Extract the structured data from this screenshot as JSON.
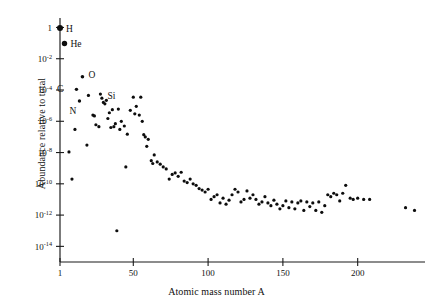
{
  "chart_data": {
    "type": "scatter",
    "title": "",
    "xlabel": "Atomic mass number A",
    "ylabel": "Abundance relative to total",
    "xlim": [
      1,
      245
    ],
    "ylim": [
      1e-15,
      3
    ],
    "yscale": "log",
    "xscale": "linear",
    "grid": false,
    "legend": null,
    "xticks": [
      1,
      50,
      100,
      150,
      200
    ],
    "xticklabels": [
      "1",
      "50",
      "100",
      "150",
      "200"
    ],
    "yticks": [
      1,
      0.01,
      0.0001,
      1e-06,
      1e-08,
      1e-10,
      1e-12,
      1e-14
    ],
    "yticklabels": [
      "1",
      "10-2",
      "10-4",
      "10-6",
      "10-8",
      "10-10",
      "10-12",
      "10-14"
    ],
    "yticklabels_display": [
      {
        "base": "1",
        "exp": ""
      },
      {
        "base": "10",
        "exp": "-2"
      },
      {
        "base": "10",
        "exp": "-4"
      },
      {
        "base": "10",
        "exp": "-6"
      },
      {
        "base": "10",
        "exp": "-8"
      },
      {
        "base": "10",
        "exp": "-10"
      },
      {
        "base": "10",
        "exp": "-12"
      },
      {
        "base": "10",
        "exp": "-14"
      }
    ],
    "annotations": [
      {
        "text": "H",
        "x": 1,
        "y": 0.92,
        "dx": 6,
        "dy": 3.5
      },
      {
        "text": "He",
        "x": 4,
        "y": 0.095,
        "dx": 6,
        "dy": 3.5
      },
      {
        "text": "C",
        "x": 12,
        "y": 0.00011,
        "dx": -13,
        "dy": 3.0
      },
      {
        "text": "N",
        "x": 14,
        "y": 1.9e-05,
        "dx": -3,
        "dy": 13
      },
      {
        "text": "O",
        "x": 16,
        "y": 0.0007,
        "dx": 6,
        "dy": 1.0
      },
      {
        "text": "Si",
        "x": 28,
        "y": 5.5e-05,
        "dx": 7,
        "dy": 5.0
      }
    ],
    "points": [
      {
        "x": 1,
        "y": 0.92,
        "r": 3.0
      },
      {
        "x": 4,
        "y": 0.095,
        "r": 2.7
      },
      {
        "x": 7,
        "y": 1.1e-08,
        "r": 1.6
      },
      {
        "x": 9,
        "y": 2e-10,
        "r": 1.6
      },
      {
        "x": 11,
        "y": 3e-07,
        "r": 1.6
      },
      {
        "x": 12,
        "y": 0.00011,
        "r": 1.7
      },
      {
        "x": 14,
        "y": 2e-05,
        "r": 1.7
      },
      {
        "x": 16,
        "y": 0.0007,
        "r": 1.8
      },
      {
        "x": 19,
        "y": 3e-08,
        "r": 1.6
      },
      {
        "x": 20,
        "y": 4.5e-05,
        "r": 1.6
      },
      {
        "x": 23,
        "y": 2.5e-06,
        "r": 1.6
      },
      {
        "x": 24,
        "y": 2.2e-06,
        "r": 1.6
      },
      {
        "x": 25,
        "y": 6e-07,
        "r": 1.6
      },
      {
        "x": 27,
        "y": 4.5e-07,
        "r": 1.6
      },
      {
        "x": 28,
        "y": 5.5e-05,
        "r": 1.6
      },
      {
        "x": 29,
        "y": 3e-05,
        "r": 1.6
      },
      {
        "x": 30,
        "y": 1.6e-05,
        "r": 1.6
      },
      {
        "x": 31,
        "y": 1.3e-05,
        "r": 1.6
      },
      {
        "x": 32,
        "y": 2.2e-05,
        "r": 1.6
      },
      {
        "x": 33,
        "y": 1.5e-06,
        "r": 1.6
      },
      {
        "x": 34,
        "y": 3.5e-06,
        "r": 1.6
      },
      {
        "x": 35,
        "y": 4e-07,
        "r": 1.6
      },
      {
        "x": 36,
        "y": 5.5e-06,
        "r": 1.6
      },
      {
        "x": 37,
        "y": 4.5e-07,
        "r": 1.6
      },
      {
        "x": 38,
        "y": 7e-07,
        "r": 1.6
      },
      {
        "x": 39,
        "y": 1e-13,
        "r": 1.6
      },
      {
        "x": 40,
        "y": 6e-06,
        "r": 1.6
      },
      {
        "x": 41,
        "y": 3e-07,
        "r": 1.6
      },
      {
        "x": 42,
        "y": 1e-06,
        "r": 1.6
      },
      {
        "x": 44,
        "y": 5e-07,
        "r": 1.6
      },
      {
        "x": 45,
        "y": 1.2e-09,
        "r": 1.6
      },
      {
        "x": 46,
        "y": 1.5e-07,
        "r": 1.6
      },
      {
        "x": 48,
        "y": 5e-06,
        "r": 1.6
      },
      {
        "x": 50,
        "y": 3.5e-05,
        "r": 1.6
      },
      {
        "x": 51,
        "y": 3e-06,
        "r": 1.6
      },
      {
        "x": 52,
        "y": 9e-06,
        "r": 1.6
      },
      {
        "x": 54,
        "y": 2.5e-06,
        "r": 1.6
      },
      {
        "x": 55,
        "y": 3.5e-05,
        "r": 1.6
      },
      {
        "x": 56,
        "y": 1e-06,
        "r": 1.6
      },
      {
        "x": 57,
        "y": 1.4e-07,
        "r": 1.6
      },
      {
        "x": 58,
        "y": 1e-07,
        "r": 1.6
      },
      {
        "x": 59,
        "y": 2.5e-08,
        "r": 1.6
      },
      {
        "x": 60,
        "y": 7e-08,
        "r": 1.6
      },
      {
        "x": 62,
        "y": 3e-09,
        "r": 1.6
      },
      {
        "x": 63,
        "y": 2e-09,
        "r": 1.6
      },
      {
        "x": 64,
        "y": 7e-09,
        "r": 1.6
      },
      {
        "x": 66,
        "y": 2.5e-09,
        "r": 1.6
      },
      {
        "x": 68,
        "y": 1.8e-09,
        "r": 1.6
      },
      {
        "x": 70,
        "y": 1.2e-09,
        "r": 1.6
      },
      {
        "x": 72,
        "y": 9e-10,
        "r": 1.6
      },
      {
        "x": 74,
        "y": 2e-10,
        "r": 1.6
      },
      {
        "x": 76,
        "y": 4e-10,
        "r": 1.6
      },
      {
        "x": 78,
        "y": 5e-10,
        "r": 1.6
      },
      {
        "x": 80,
        "y": 3e-10,
        "r": 1.6
      },
      {
        "x": 82,
        "y": 5.5e-10,
        "r": 1.6
      },
      {
        "x": 84,
        "y": 1.5e-10,
        "r": 1.6
      },
      {
        "x": 86,
        "y": 1.2e-10,
        "r": 1.6
      },
      {
        "x": 88,
        "y": 2e-10,
        "r": 1.6
      },
      {
        "x": 90,
        "y": 1e-10,
        "r": 1.6
      },
      {
        "x": 92,
        "y": 8e-11,
        "r": 1.6
      },
      {
        "x": 94,
        "y": 5e-11,
        "r": 1.6
      },
      {
        "x": 96,
        "y": 4e-11,
        "r": 1.6
      },
      {
        "x": 98,
        "y": 3e-11,
        "r": 1.6
      },
      {
        "x": 100,
        "y": 4.5e-11,
        "r": 1.6
      },
      {
        "x": 102,
        "y": 1e-11,
        "r": 1.6
      },
      {
        "x": 104,
        "y": 1.5e-11,
        "r": 1.6
      },
      {
        "x": 106,
        "y": 2e-11,
        "r": 1.6
      },
      {
        "x": 108,
        "y": 6e-12,
        "r": 1.6
      },
      {
        "x": 110,
        "y": 1.2e-11,
        "r": 1.6
      },
      {
        "x": 112,
        "y": 5e-12,
        "r": 1.6
      },
      {
        "x": 114,
        "y": 9e-12,
        "r": 1.6
      },
      {
        "x": 116,
        "y": 2e-11,
        "r": 1.6
      },
      {
        "x": 118,
        "y": 4.5e-11,
        "r": 1.6
      },
      {
        "x": 120,
        "y": 3e-11,
        "r": 1.6
      },
      {
        "x": 122,
        "y": 7e-12,
        "r": 1.6
      },
      {
        "x": 124,
        "y": 1e-11,
        "r": 1.6
      },
      {
        "x": 126,
        "y": 3.5e-11,
        "r": 1.6
      },
      {
        "x": 128,
        "y": 1.2e-11,
        "r": 1.6
      },
      {
        "x": 130,
        "y": 2e-11,
        "r": 1.6
      },
      {
        "x": 132,
        "y": 1e-11,
        "r": 1.6
      },
      {
        "x": 134,
        "y": 5e-12,
        "r": 1.6
      },
      {
        "x": 136,
        "y": 7e-12,
        "r": 1.6
      },
      {
        "x": 138,
        "y": 1.5e-11,
        "r": 1.6
      },
      {
        "x": 140,
        "y": 6e-12,
        "r": 1.6
      },
      {
        "x": 142,
        "y": 4e-12,
        "r": 1.6
      },
      {
        "x": 144,
        "y": 9e-12,
        "r": 1.6
      },
      {
        "x": 146,
        "y": 5e-12,
        "r": 1.6
      },
      {
        "x": 148,
        "y": 2.5e-12,
        "r": 1.6
      },
      {
        "x": 150,
        "y": 4e-12,
        "r": 1.6
      },
      {
        "x": 152,
        "y": 8e-12,
        "r": 1.6
      },
      {
        "x": 154,
        "y": 3e-12,
        "r": 1.6
      },
      {
        "x": 156,
        "y": 7e-12,
        "r": 1.6
      },
      {
        "x": 158,
        "y": 2.5e-12,
        "r": 1.6
      },
      {
        "x": 160,
        "y": 6e-12,
        "r": 1.6
      },
      {
        "x": 162,
        "y": 8e-12,
        "r": 1.6
      },
      {
        "x": 164,
        "y": 2e-12,
        "r": 1.6
      },
      {
        "x": 166,
        "y": 7e-12,
        "r": 1.6
      },
      {
        "x": 168,
        "y": 3.5e-12,
        "r": 1.6
      },
      {
        "x": 170,
        "y": 6e-12,
        "r": 1.6
      },
      {
        "x": 172,
        "y": 2e-12,
        "r": 1.6
      },
      {
        "x": 174,
        "y": 7e-12,
        "r": 1.6
      },
      {
        "x": 176,
        "y": 1.5e-12,
        "r": 1.6
      },
      {
        "x": 178,
        "y": 4e-12,
        "r": 1.6
      },
      {
        "x": 180,
        "y": 2e-11,
        "r": 1.6
      },
      {
        "x": 182,
        "y": 1.5e-11,
        "r": 1.6
      },
      {
        "x": 184,
        "y": 2.5e-11,
        "r": 1.6
      },
      {
        "x": 186,
        "y": 2e-11,
        "r": 1.6
      },
      {
        "x": 188,
        "y": 8e-12,
        "r": 1.6
      },
      {
        "x": 190,
        "y": 2.5e-11,
        "r": 1.6
      },
      {
        "x": 192,
        "y": 8e-11,
        "r": 1.6
      },
      {
        "x": 195,
        "y": 1.2e-11,
        "r": 1.6
      },
      {
        "x": 197,
        "y": 1e-11,
        "r": 1.6
      },
      {
        "x": 200,
        "y": 1.2e-11,
        "r": 1.6
      },
      {
        "x": 204,
        "y": 1e-11,
        "r": 1.6
      },
      {
        "x": 208,
        "y": 1e-11,
        "r": 1.6
      },
      {
        "x": 232,
        "y": 3e-12,
        "r": 1.6
      },
      {
        "x": 238,
        "y": 2e-12,
        "r": 1.6
      }
    ]
  },
  "plot_geometry": {
    "left": 60,
    "right": 425,
    "top": 20,
    "bottom": 262
  }
}
